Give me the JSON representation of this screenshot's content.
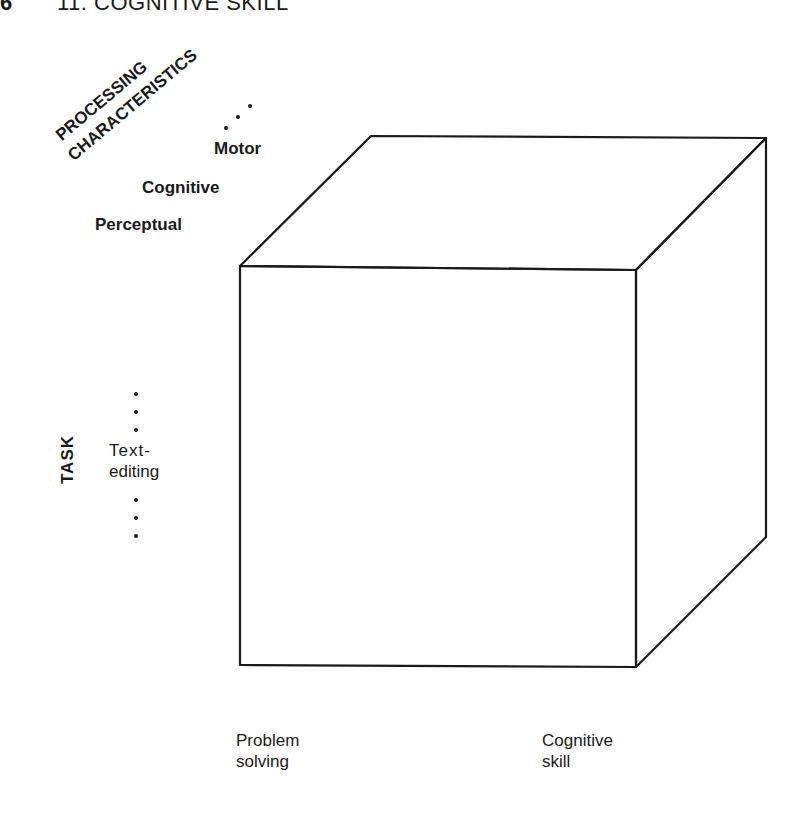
{
  "header": {
    "page_number_fragment": "6",
    "chapter_title": "11. COGNITIVE SKILL"
  },
  "diagram": {
    "type": "3d-cube-taxonomy",
    "axes": {
      "processing_characteristics": {
        "title_line1": "PROCESSING",
        "title_line2": "CHARACTERISTICS",
        "values": [
          "Perceptual",
          "Cognitive",
          "Motor"
        ],
        "continuation": "..."
      },
      "task": {
        "title": "TASK",
        "values": [
          "Text-",
          "editing"
        ],
        "continuation": "..."
      },
      "skill_level": {
        "values": [
          {
            "line1": "Problem",
            "line2": "solving"
          },
          {
            "line1": "Cognitive",
            "line2": "skill"
          }
        ]
      }
    },
    "line_color": "#1a1a1a"
  }
}
